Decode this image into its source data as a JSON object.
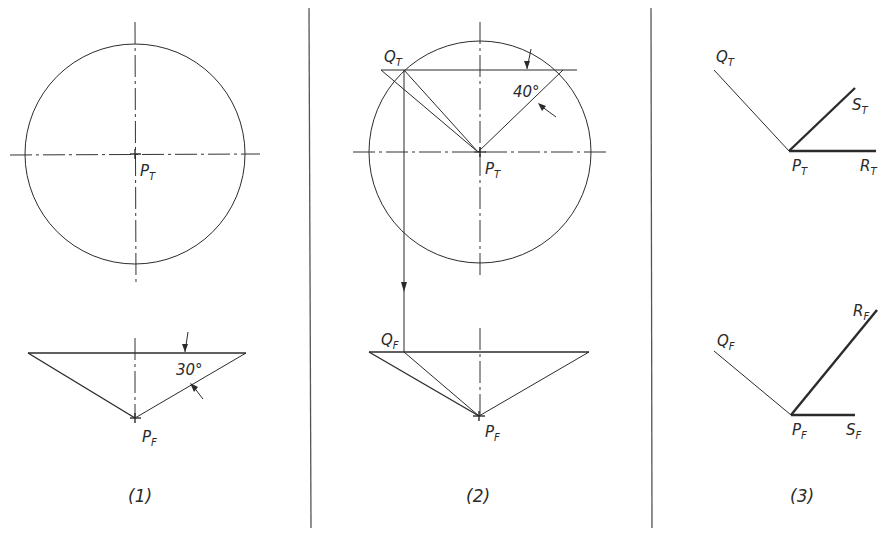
{
  "figure": {
    "panels": [
      {
        "caption": "(1)",
        "top_view": {
          "point_label": "P",
          "point_sub": "T"
        },
        "front_view": {
          "point_label": "P",
          "point_sub": "F",
          "angle_label": "30°"
        }
      },
      {
        "caption": "(2)",
        "top_view": {
          "point_label": "P",
          "point_sub": "T",
          "q_label": "Q",
          "q_sub": "T",
          "angle_label": "40°"
        },
        "front_view": {
          "point_label": "P",
          "point_sub": "F",
          "q_label": "Q",
          "q_sub": "F"
        }
      },
      {
        "caption": "(3)",
        "top_view": {
          "q_label": "Q",
          "q_sub": "T",
          "s_label": "S",
          "s_sub": "T",
          "p_label": "P",
          "p_sub": "T",
          "r_label": "R",
          "r_sub": "T"
        },
        "front_view": {
          "q_label": "Q",
          "q_sub": "F",
          "r_label": "R",
          "r_sub": "F",
          "p_label": "P",
          "p_sub": "F",
          "s_label": "S",
          "s_sub": "F"
        }
      }
    ]
  },
  "colors": {
    "ink": "#2b2b2b",
    "paper": "#ffffff"
  }
}
